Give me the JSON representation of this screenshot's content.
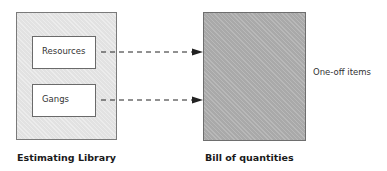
{
  "diagram": {
    "left_container": {
      "caption": "Estimating Library",
      "items": [
        {
          "label": "Resources"
        },
        {
          "label": "Gangs"
        }
      ]
    },
    "right_container": {
      "caption": "Bill of quantities",
      "side_label": "One-off items"
    },
    "connectors": [
      {
        "from": "Resources",
        "to": "Bill of quantities",
        "style": "dashed-arrow"
      },
      {
        "from": "Gangs",
        "to": "Bill of quantities",
        "style": "dashed-arrow"
      }
    ],
    "colors": {
      "library_fill": "#e2e2e2",
      "boq_fill": "#a9a9a9",
      "inner_fill": "#ffffff",
      "arrow": "#222222"
    }
  }
}
